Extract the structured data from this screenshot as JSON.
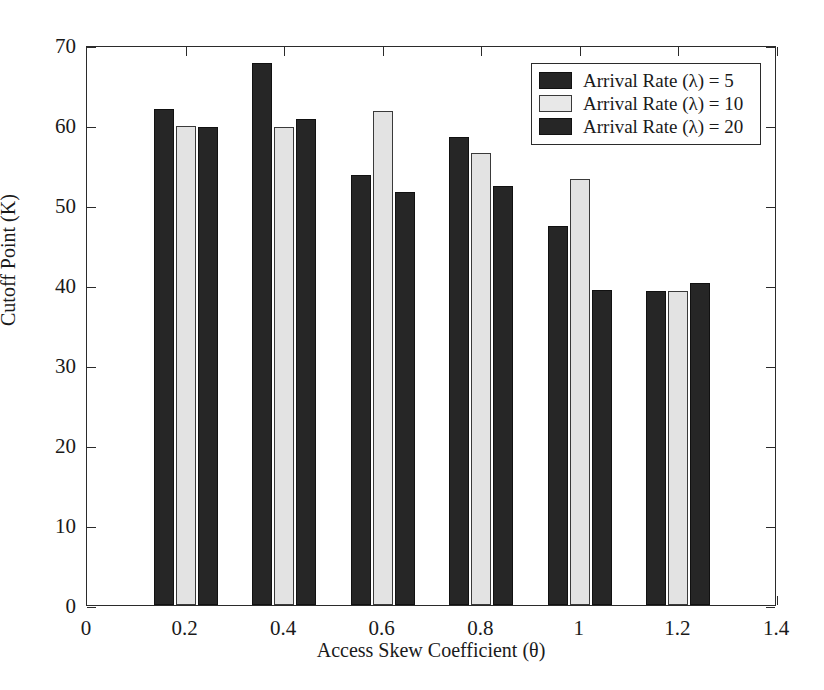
{
  "chart_data": {
    "type": "bar",
    "title": "",
    "xlabel": "Access Skew Coefficient (θ)",
    "ylabel": "Cutoff Point (K)",
    "categories": [
      "0.2",
      "0.4",
      "0.6",
      "0.8",
      "1",
      "1.2"
    ],
    "x": [
      0.2,
      0.4,
      0.6,
      0.8,
      1.0,
      1.2
    ],
    "series": [
      {
        "name": "Arrival Rate (λ) = 5",
        "values": [
          62.0,
          67.8,
          53.8,
          58.5,
          47.4,
          39.3
        ]
      },
      {
        "name": "Arrival Rate (λ) = 10",
        "values": [
          59.9,
          59.7,
          61.7,
          56.5,
          53.3,
          39.2
        ]
      },
      {
        "name": "Arrival Rate (λ) = 20",
        "values": [
          59.8,
          60.7,
          51.6,
          52.4,
          39.4,
          40.2
        ]
      }
    ],
    "xlim": [
      0,
      1.4
    ],
    "ylim": [
      0,
      70
    ],
    "xticks": [
      "0",
      "0.2",
      "0.4",
      "0.6",
      "0.8",
      "1",
      "1.2",
      "1.4"
    ],
    "xtick_values": [
      0,
      0.2,
      0.4,
      0.6,
      0.8,
      1.0,
      1.2,
      1.4
    ],
    "yticks": [
      "0",
      "10",
      "20",
      "30",
      "40",
      "50",
      "60",
      "70"
    ],
    "ytick_values": [
      0,
      10,
      20,
      30,
      40,
      50,
      60,
      70
    ],
    "grid": false,
    "legend_position": "top-right",
    "colors": {
      "series_0": "#262626",
      "series_1": "#e3e3e3",
      "series_2": "#262626",
      "axis": "#2b2b2b",
      "background": "#ffffff"
    }
  },
  "legend": {
    "items": [
      {
        "label": "Arrival Rate (λ) = 5"
      },
      {
        "label": "Arrival Rate (λ) = 10"
      },
      {
        "label": "Arrival Rate (λ) = 20"
      }
    ]
  }
}
